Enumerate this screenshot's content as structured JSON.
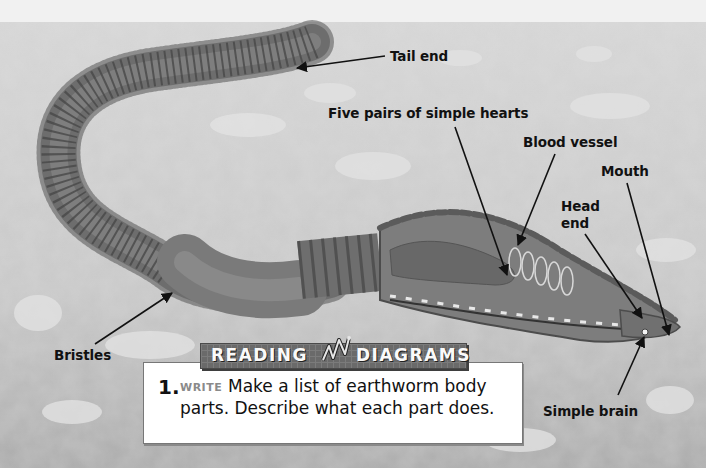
{
  "diagram": {
    "colors": {
      "background": "#c9c9c9",
      "worm_body": "#777777",
      "worm_ring": "#4d4d4d",
      "banner": "#6a6a6a",
      "label_text": "#111111",
      "tag_text": "#8a8a8a"
    },
    "labels": [
      {
        "id": "tail-end",
        "text": "Tail end"
      },
      {
        "id": "five-pairs-hearts",
        "text": "Five pairs of simple hearts"
      },
      {
        "id": "blood-vessel",
        "text": "Blood vessel"
      },
      {
        "id": "mouth",
        "text": "Mouth"
      },
      {
        "id": "head",
        "text": "Head"
      },
      {
        "id": "end",
        "text": "end"
      },
      {
        "id": "bristles",
        "text": "Bristles"
      },
      {
        "id": "simple-brain",
        "text": "Simple brain"
      }
    ]
  },
  "reading_box": {
    "banner_left": "READING",
    "banner_right": "DIAGRAMS",
    "question_number": "1.",
    "question_tag": "WRITE",
    "question_line1": "Make a list of earthworm body",
    "question_line2": "parts. Describe what each part does."
  }
}
